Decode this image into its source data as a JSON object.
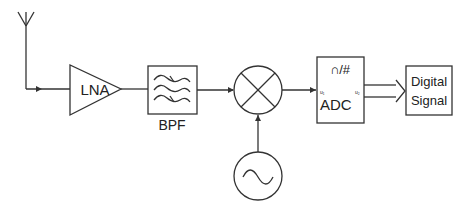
{
  "diagram": {
    "stroke_color": "#333333",
    "blocks": {
      "antenna": {
        "label": ""
      },
      "lna": {
        "label": "LNA"
      },
      "bpf": {
        "label": "BPF"
      },
      "mixer": {
        "label": ""
      },
      "oscillator": {
        "label": ""
      },
      "adc": {
        "label": "ADC",
        "symbol": "∩/#",
        "input_pin": "u₁",
        "output_pin": "u₂"
      },
      "output": {
        "line1": "Digital",
        "line2": "Signal"
      }
    }
  }
}
